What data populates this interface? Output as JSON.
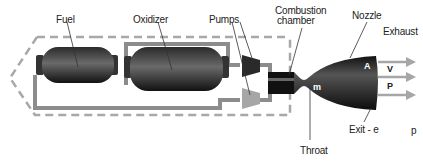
{
  "diagram": {
    "labels": {
      "fuel": "Fuel",
      "oxidizer": "Oxidizer",
      "pumps": "Pumps",
      "combustion_chamber_line1": "Combustion",
      "combustion_chamber_line2": "chamber",
      "nozzle": "Nozzle",
      "exhaust": "Exhaust",
      "throat": "Throat",
      "exit": "Exit - e",
      "mass_flow": "m",
      "area": "A",
      "velocity": "V",
      "pressure": "P",
      "ambient_pressure": "p"
    },
    "colors": {
      "tank": "#1a1a1a",
      "tank_highlight": "#6a6a6a",
      "pipe": "#8c8c8c",
      "dashed_outline": "#a8a8a8",
      "fuel_pump": "#2a2a2a",
      "oxidizer_pump": "#a6a6a6",
      "exhaust_arrow": "#a6a6a6",
      "leader_line": "#333333"
    }
  }
}
